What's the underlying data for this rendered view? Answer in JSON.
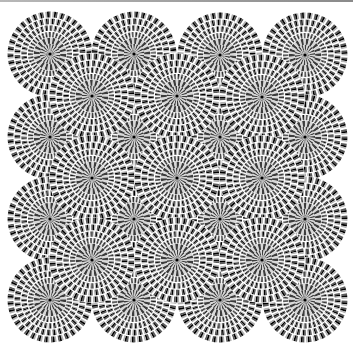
{
  "image": {
    "title": "Rotating snakes optical illusion",
    "width": 353,
    "height": 349,
    "background": "#ffffff",
    "border_color": "#9a9a9a"
  },
  "pattern": {
    "disk_radius": 43,
    "rings": 7,
    "segments": 36,
    "colors": [
      "#000000",
      "#5a5a5a",
      "#ffffff",
      "#b4b4b4"
    ],
    "checker_dark": "#3c3c3c",
    "checker_light": "#d8d8d8",
    "center_dot": "#000000"
  },
  "disks": {
    "main_grid": [
      {
        "x": 50,
        "y": 54
      },
      {
        "x": 134,
        "y": 54
      },
      {
        "x": 220,
        "y": 55
      },
      {
        "x": 305,
        "y": 55
      },
      {
        "x": 50,
        "y": 137
      },
      {
        "x": 134,
        "y": 137
      },
      {
        "x": 220,
        "y": 137
      },
      {
        "x": 305,
        "y": 137
      },
      {
        "x": 50,
        "y": 219
      },
      {
        "x": 134,
        "y": 219
      },
      {
        "x": 220,
        "y": 219
      },
      {
        "x": 305,
        "y": 219
      },
      {
        "x": 50,
        "y": 300
      },
      {
        "x": 134,
        "y": 300
      },
      {
        "x": 220,
        "y": 300
      },
      {
        "x": 305,
        "y": 300
      }
    ],
    "offset_grid": [
      {
        "x": 92,
        "y": 96
      },
      {
        "x": 177,
        "y": 96
      },
      {
        "x": 262,
        "y": 97
      },
      {
        "x": 92,
        "y": 178
      },
      {
        "x": 177,
        "y": 178
      },
      {
        "x": 262,
        "y": 178
      },
      {
        "x": 92,
        "y": 260
      },
      {
        "x": 177,
        "y": 260
      },
      {
        "x": 262,
        "y": 260
      }
    ]
  }
}
